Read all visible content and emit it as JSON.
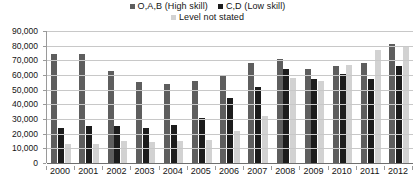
{
  "chart_data": {
    "type": "bar",
    "title": "",
    "subtitle": "",
    "xlabel": "",
    "ylabel": "",
    "grid": true,
    "legend_position": "top",
    "ylim": [
      0,
      90000
    ],
    "ytick_labels": [
      "90,000",
      "80,000",
      "70,000",
      "60,000",
      "50,000",
      "40,000",
      "30,000",
      "20,000",
      "10,000",
      "0"
    ],
    "ytick_values": [
      90000,
      80000,
      70000,
      60000,
      50000,
      40000,
      30000,
      20000,
      10000,
      0
    ],
    "categories": [
      "2000",
      "2001",
      "2002",
      "2003",
      "2004",
      "2005",
      "2006",
      "2007",
      "2008",
      "2009",
      "2010",
      "2011",
      "2012"
    ],
    "series": [
      {
        "name": "O,A,B (High skill)",
        "color": "#5e5e5e",
        "values": [
          74000,
          74000,
          63000,
          55000,
          54000,
          56000,
          59000,
          68000,
          71000,
          64000,
          66000,
          68000,
          81000
        ]
      },
      {
        "name": "C,D (Low skill)",
        "color": "#1c1c1c",
        "values": [
          24000,
          25000,
          25000,
          24000,
          26000,
          31000,
          44000,
          52000,
          64000,
          57000,
          61000,
          57000,
          66000
        ]
      },
      {
        "name": "Level not stated",
        "color": "#d2d2d2",
        "values": [
          13000,
          13000,
          15000,
          14000,
          15000,
          16000,
          22000,
          32000,
          58000,
          56000,
          67000,
          77000,
          80000
        ]
      }
    ]
  },
  "legend": {
    "entries": [
      {
        "label": "O,A,B (High skill)",
        "color": "#5e5e5e",
        "swatch_name": "legend-swatch-high-skill"
      },
      {
        "label": "C,D (Low skill)",
        "color": "#1c1c1c",
        "swatch_name": "legend-swatch-low-skill"
      },
      {
        "label": "Level not stated",
        "color": "#d2d2d2",
        "swatch_name": "legend-swatch-not-stated"
      }
    ]
  },
  "axes": {
    "y_max_label": "90,000",
    "y_min_label": "0"
  }
}
